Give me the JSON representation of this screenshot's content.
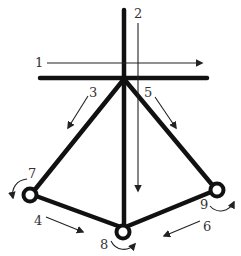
{
  "diagram": {
    "colors": {
      "structure": "#111111",
      "arrow": "#222222",
      "label": "#333333",
      "background": "#ffffff"
    },
    "labels": {
      "l1": "1",
      "l2": "2",
      "l3": "3",
      "l4": "4",
      "l5": "5",
      "l6": "6",
      "l7": "7",
      "l8": "8",
      "l9": "9"
    },
    "elements": [
      {
        "id": "1",
        "kind": "straight-arrow",
        "direction": "right"
      },
      {
        "id": "2",
        "kind": "straight-arrow",
        "direction": "down"
      },
      {
        "id": "3",
        "kind": "straight-arrow",
        "direction": "down-left"
      },
      {
        "id": "4",
        "kind": "straight-arrow",
        "direction": "down-right"
      },
      {
        "id": "5",
        "kind": "straight-arrow",
        "direction": "down-right"
      },
      {
        "id": "6",
        "kind": "straight-arrow",
        "direction": "down-left"
      },
      {
        "id": "7",
        "kind": "curved-arrow",
        "direction": "counter-clockwise",
        "at": "left pivot"
      },
      {
        "id": "8",
        "kind": "curved-arrow",
        "direction": "counter-clockwise",
        "at": "bottom pivot"
      },
      {
        "id": "9",
        "kind": "curved-arrow",
        "direction": "counter-clockwise",
        "at": "right pivot"
      }
    ]
  }
}
